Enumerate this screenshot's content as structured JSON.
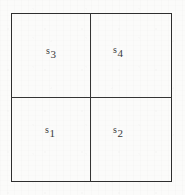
{
  "figure": {
    "shape": "square",
    "subdivisions": 4,
    "stroke_color": "#2e2e2e",
    "background_color": "#fbfbfa",
    "text_color": "#3a3a3a",
    "quadrants": [
      {
        "id": "top-left",
        "base": "s",
        "subscript": "3",
        "label": "s3"
      },
      {
        "id": "top-right",
        "base": "s",
        "subscript": "4",
        "label": "s4"
      },
      {
        "id": "bottom-left",
        "base": "s",
        "subscript": "1",
        "label": "s1"
      },
      {
        "id": "bottom-right",
        "base": "s",
        "subscript": "2",
        "label": "s2"
      }
    ]
  }
}
